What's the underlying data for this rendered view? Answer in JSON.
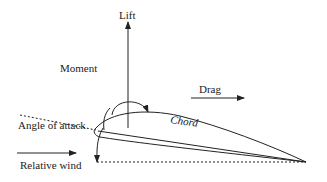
{
  "diagram": {
    "labels": {
      "lift": "Lift",
      "moment": "Moment",
      "drag": "Drag",
      "chord": "Chord",
      "angle_of_attack": "Angle of attack",
      "relative_wind": "Relative wind"
    },
    "colors": {
      "stroke": "#222222",
      "background": "#ffffff"
    }
  }
}
